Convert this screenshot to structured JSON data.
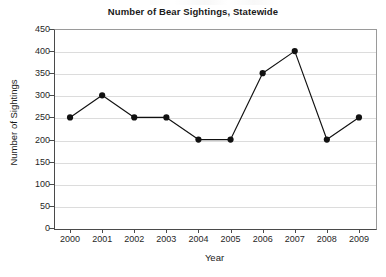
{
  "chart_data": {
    "type": "line",
    "title": "Number of Bear Sightings, Statewide",
    "xlabel": "Year",
    "ylabel": "Number of Sightings",
    "categories": [
      "2000",
      "2001",
      "2002",
      "2003",
      "2004",
      "2005",
      "2006",
      "2007",
      "2008",
      "2009"
    ],
    "values": [
      250,
      300,
      250,
      250,
      200,
      200,
      350,
      400,
      200,
      250
    ],
    "series": [
      {
        "name": "Bear Sightings",
        "values": [
          250,
          300,
          250,
          250,
          200,
          200,
          350,
          400,
          200,
          250
        ]
      }
    ],
    "ylim": [
      0,
      450
    ],
    "yticks": [
      0,
      50,
      100,
      150,
      200,
      250,
      300,
      350,
      400,
      450
    ],
    "ytick_labels": [
      "0",
      "50",
      "100",
      "150",
      "200",
      "250",
      "300",
      "350",
      "400",
      "450"
    ],
    "xtick_labels": [
      "2000",
      "2001",
      "2002",
      "2003",
      "2004",
      "2005",
      "2006",
      "2007",
      "2008",
      "2009"
    ],
    "grid": true,
    "grid_axis": "y",
    "legend": false,
    "legend_position": "none",
    "marker": "filled-circle",
    "colors": {
      "line": "#111111",
      "marker": "#111111",
      "gridline": "#dcdcdc",
      "axis": "#4a4a4a",
      "background": "#ffffff",
      "text": "#1a1a1a"
    }
  }
}
